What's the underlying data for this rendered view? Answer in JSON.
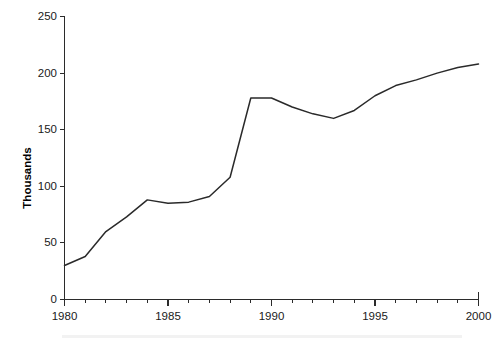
{
  "chart_data": {
    "type": "line",
    "title": "",
    "subtitle": "",
    "xlabel": "",
    "ylabel": "Thousands",
    "x": [
      1980,
      1981,
      1982,
      1983,
      1984,
      1985,
      1986,
      1987,
      1988,
      1989,
      1990,
      1991,
      1992,
      1993,
      1994,
      1995,
      1996,
      1997,
      1998,
      1999,
      2000
    ],
    "values": [
      30,
      38,
      60,
      73,
      88,
      85,
      86,
      91,
      108,
      178,
      178,
      170,
      164,
      160,
      167,
      180,
      189,
      194,
      200,
      205,
      208
    ],
    "series": [
      {
        "name": "",
        "values": [
          30,
          38,
          60,
          73,
          88,
          85,
          86,
          91,
          108,
          178,
          178,
          170,
          164,
          160,
          167,
          180,
          189,
          194,
          200,
          205,
          208
        ]
      }
    ],
    "xlim": [
      1980,
      2000
    ],
    "ylim": [
      0,
      250
    ],
    "x_ticks": [
      1980,
      1985,
      1990,
      1995,
      2000
    ],
    "x_tick_labels": [
      "1980",
      "1985",
      "1990",
      "1995",
      "2000"
    ],
    "x_minor_tick_interval": 1,
    "y_ticks": [
      0,
      50,
      100,
      150,
      200,
      250
    ],
    "y_tick_labels": [
      "0",
      "50",
      "100",
      "150",
      "200",
      "250"
    ],
    "grid": false,
    "legend": false,
    "legend_position": "none",
    "line_color": "#2a2a2a",
    "axis_color": "#2b2b2b",
    "background_color": "#ffffff"
  },
  "axes": {
    "y_title": "Thousands",
    "y_tick_labels": [
      "250",
      "200",
      "150",
      "100",
      "50",
      "0"
    ],
    "x_tick_labels": [
      "1980",
      "1985",
      "1990",
      "1995",
      "2000"
    ]
  }
}
